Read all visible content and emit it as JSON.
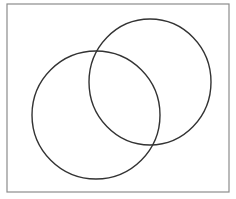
{
  "diagram": {
    "type": "venn",
    "background_color": "#ffffff",
    "frame": {
      "x": 7,
      "y": 4,
      "width": 222,
      "height": 188,
      "stroke": "#8c8c8c",
      "stroke_width": 1.2
    },
    "sets": [
      {
        "name": "left-circle",
        "label": "",
        "cx": 96,
        "cy": 115,
        "rx": 64,
        "ry": 64,
        "stroke": "#333333",
        "stroke_width": 1.4,
        "fill": "none"
      },
      {
        "name": "right-circle",
        "label": "",
        "cx": 150,
        "cy": 82,
        "rx": 61,
        "ry": 63,
        "stroke": "#333333",
        "stroke_width": 1.4,
        "fill": "none"
      }
    ],
    "intersections": [
      {
        "x": 96,
        "y": 51
      },
      {
        "x": 149,
        "y": 148
      }
    ]
  }
}
